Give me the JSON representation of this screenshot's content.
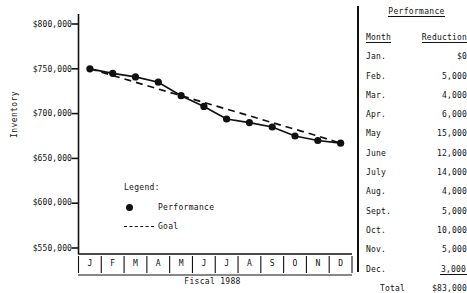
{
  "chart_data": {
    "type": "line",
    "title": "",
    "xlabel": "Fiscal 1988",
    "ylabel": "Inventory",
    "ylim": [
      550000,
      800000
    ],
    "yticks": [
      800000,
      750000,
      700000,
      650000,
      600000,
      550000
    ],
    "ytick_labels": [
      "$800,000",
      "$750,000",
      "$700,000",
      "$650,000",
      "$600,000",
      "$550,000"
    ],
    "grid": false,
    "legend_position": "inside-lower-center",
    "categories": [
      "J",
      "F",
      "M",
      "A",
      "M",
      "J",
      "J",
      "A",
      "S",
      "O",
      "N",
      "D"
    ],
    "category_names": [
      "Jan.",
      "Feb.",
      "Mar.",
      "Apr.",
      "May",
      "June",
      "July",
      "Aug.",
      "Sept.",
      "Oct.",
      "Nov.",
      "Dec."
    ],
    "series": [
      {
        "name": "Performance",
        "style": "solid-with-markers",
        "values": [
          750000,
          745000,
          741000,
          735000,
          720000,
          708000,
          694000,
          690000,
          685000,
          675000,
          670000,
          667000
        ]
      },
      {
        "name": "Goal",
        "style": "dashed",
        "values": [
          750000,
          742500,
          735000,
          727500,
          720000,
          712500,
          705000,
          697500,
          690000,
          682500,
          675000,
          667000
        ]
      }
    ]
  },
  "chart": {
    "ylabel": "Inventory",
    "xlabel": "Fiscal 1988",
    "ytick_labels": [
      "$800,000",
      "$750,000",
      "$700,000",
      "$650,000",
      "$600,000",
      "$550,000"
    ],
    "xtick_labels": [
      "J",
      "F",
      "M",
      "A",
      "M",
      "J",
      "J",
      "A",
      "S",
      "O",
      "N",
      "D"
    ]
  },
  "legend": {
    "title": "Legend:",
    "items": [
      {
        "label": "Performance",
        "marker": "filled-circle"
      },
      {
        "label": "Goal",
        "marker": "dashed-line"
      }
    ]
  },
  "table": {
    "title": "Performance",
    "headers": [
      "Month",
      "Reduction"
    ],
    "rows": [
      {
        "month": "Jan.",
        "reduction": "$0"
      },
      {
        "month": "Feb.",
        "reduction": "5,000"
      },
      {
        "month": "Mar.",
        "reduction": "4,000"
      },
      {
        "month": "Apr.",
        "reduction": "6,000"
      },
      {
        "month": "May",
        "reduction": "15,000"
      },
      {
        "month": "June",
        "reduction": "12,000"
      },
      {
        "month": "July",
        "reduction": "14,000"
      },
      {
        "month": "Aug.",
        "reduction": "4,000"
      },
      {
        "month": "Sept.",
        "reduction": "5,000"
      },
      {
        "month": "Oct.",
        "reduction": "10,000"
      },
      {
        "month": "Nov.",
        "reduction": "5,000"
      },
      {
        "month": "Dec.",
        "reduction": "3,000"
      }
    ],
    "total_label": "Total",
    "total_value": "$83,000"
  },
  "colors": {
    "ink": "#111111",
    "background": "#ffffff"
  }
}
